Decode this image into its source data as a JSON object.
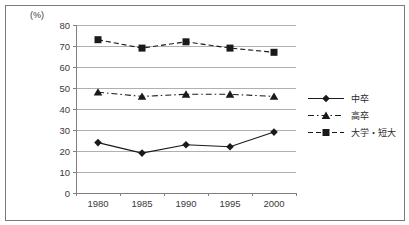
{
  "frame": {
    "background": "#ffffff",
    "border_color": "#7a7a7a"
  },
  "chart_data": {
    "type": "line",
    "unit_label": "(%)",
    "categories": [
      "1980",
      "1985",
      "1990",
      "1995",
      "2000"
    ],
    "series": [
      {
        "name": "中卒",
        "values": [
          24,
          19,
          23,
          22,
          29
        ],
        "marker": "diamond",
        "line_style": "solid",
        "color": "#1a1a1a"
      },
      {
        "name": "高卒",
        "values": [
          48,
          46,
          47,
          47,
          46
        ],
        "marker": "triangle",
        "line_style": "dashdot",
        "color": "#1a1a1a"
      },
      {
        "name": "大学・短大",
        "values": [
          73,
          69,
          72,
          69,
          67
        ],
        "marker": "square",
        "line_style": "dashed",
        "color": "#1a1a1a"
      }
    ],
    "ylim": [
      0,
      80
    ],
    "ytick_step": 10,
    "grid": true,
    "legend_position": "right",
    "axis_color": "#808080",
    "grid_color": "#b0b0b0",
    "text_color": "#3a3a3a"
  }
}
